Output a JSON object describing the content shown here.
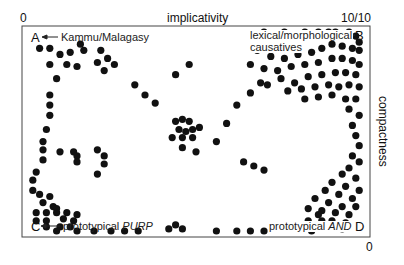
{
  "chart_data": {
    "type": "scatter",
    "title": "",
    "xlabel": "implicativity",
    "ylabel": "compactness",
    "x_axis_ticks": {
      "left": "0",
      "right": "10/10"
    },
    "y_axis_ticks": {
      "top": "",
      "bottom": "0"
    },
    "xlim": [
      0,
      10
    ],
    "ylim": [
      0,
      10
    ],
    "grid": false,
    "legend": null,
    "corners": {
      "A": {
        "label": "A",
        "annotation": "Kammu/Malagasy",
        "position": "top-left"
      },
      "B": {
        "label": "B",
        "annotation": "lexical/morphological causatives",
        "position": "top-right"
      },
      "C": {
        "label": "C",
        "annotation": "prototypical PURP",
        "position": "bottom-left"
      },
      "D": {
        "label": "D",
        "annotation": "prototypical AND",
        "position": "bottom-right"
      }
    },
    "points": [
      [
        0.4,
        9.1
      ],
      [
        0.7,
        9.1
      ],
      [
        1.0,
        8.8
      ],
      [
        1.3,
        8.9
      ],
      [
        1.6,
        9.3
      ],
      [
        1.7,
        9.0
      ],
      [
        0.7,
        8.3
      ],
      [
        1.2,
        8.3
      ],
      [
        1.5,
        8.2
      ],
      [
        0.9,
        7.6
      ],
      [
        2.2,
        9.0
      ],
      [
        2.4,
        8.6
      ],
      [
        2.1,
        8.4
      ],
      [
        2.6,
        8.3
      ],
      [
        2.3,
        8.0
      ],
      [
        0.7,
        6.8
      ],
      [
        0.7,
        6.3
      ],
      [
        0.7,
        5.8
      ],
      [
        0.6,
        5.1
      ],
      [
        0.5,
        4.5
      ],
      [
        0.5,
        4.1
      ],
      [
        0.5,
        3.6
      ],
      [
        0.3,
        3.0
      ],
      [
        3.2,
        7.3
      ],
      [
        3.5,
        6.8
      ],
      [
        3.8,
        6.4
      ],
      [
        4.4,
        7.8
      ],
      [
        4.8,
        8.3
      ],
      [
        4.4,
        5.5
      ],
      [
        4.6,
        5.6
      ],
      [
        4.8,
        5.5
      ],
      [
        4.5,
        5.1
      ],
      [
        4.7,
        5.0
      ],
      [
        4.9,
        5.1
      ],
      [
        5.1,
        5.2
      ],
      [
        4.3,
        4.7
      ],
      [
        4.6,
        4.7
      ],
      [
        4.9,
        4.7
      ],
      [
        4.6,
        4.2
      ],
      [
        5.0,
        4.0
      ],
      [
        5.9,
        5.4
      ],
      [
        6.2,
        6.3
      ],
      [
        6.6,
        6.9
      ],
      [
        6.9,
        7.4
      ],
      [
        5.6,
        4.5
      ],
      [
        6.4,
        3.5
      ],
      [
        6.7,
        3.3
      ],
      [
        7.0,
        3.1
      ],
      [
        1.0,
        4.0
      ],
      [
        1.4,
        4.0
      ],
      [
        1.5,
        3.8
      ],
      [
        1.5,
        3.5
      ],
      [
        2.1,
        4.1
      ],
      [
        2.3,
        3.8
      ],
      [
        2.3,
        3.4
      ],
      [
        2.1,
        2.9
      ],
      [
        0.2,
        2.6
      ],
      [
        0.2,
        2.1
      ],
      [
        0.4,
        1.9
      ],
      [
        0.7,
        1.8
      ],
      [
        0.5,
        1.5
      ],
      [
        0.8,
        1.3
      ],
      [
        0.9,
        1.2
      ],
      [
        0.3,
        1.0
      ],
      [
        0.6,
        1.0
      ],
      [
        0.9,
        1.0
      ],
      [
        1.2,
        1.0
      ],
      [
        0.3,
        0.6
      ],
      [
        0.6,
        0.6
      ],
      [
        1.1,
        0.7
      ],
      [
        1.4,
        0.6
      ],
      [
        1.5,
        0.9
      ],
      [
        0.6,
        0.3
      ],
      [
        1.0,
        0.3
      ],
      [
        1.3,
        0.3
      ],
      [
        0.9,
        0.1
      ],
      [
        1.5,
        0.1
      ],
      [
        2.0,
        0.1
      ],
      [
        2.5,
        0.1
      ],
      [
        2.9,
        0.1
      ],
      [
        3.3,
        0.1
      ],
      [
        4.2,
        0.2
      ],
      [
        4.4,
        0.4
      ],
      [
        4.6,
        0.2
      ],
      [
        5.6,
        0.1
      ],
      [
        6.2,
        0.1
      ],
      [
        6.6,
        0.1
      ],
      [
        7.0,
        0.1
      ],
      [
        7.0,
        9.9
      ],
      [
        7.6,
        9.9
      ],
      [
        8.2,
        9.9
      ],
      [
        8.6,
        9.9
      ],
      [
        8.9,
        9.9
      ],
      [
        9.1,
        9.9
      ],
      [
        9.5,
        9.9
      ],
      [
        9.7,
        9.7
      ],
      [
        9.8,
        9.4
      ],
      [
        6.8,
        9.0
      ],
      [
        7.2,
        8.7
      ],
      [
        7.6,
        8.6
      ],
      [
        8.0,
        8.8
      ],
      [
        8.4,
        8.9
      ],
      [
        8.7,
        9.1
      ],
      [
        9.0,
        9.3
      ],
      [
        9.3,
        9.2
      ],
      [
        9.6,
        9.1
      ],
      [
        9.8,
        9.0
      ],
      [
        6.6,
        8.3
      ],
      [
        7.0,
        8.1
      ],
      [
        7.4,
        8.0
      ],
      [
        7.8,
        8.2
      ],
      [
        8.2,
        8.3
      ],
      [
        8.6,
        8.4
      ],
      [
        9.0,
        8.6
      ],
      [
        9.3,
        8.6
      ],
      [
        9.6,
        8.5
      ],
      [
        9.8,
        8.3
      ],
      [
        7.5,
        7.6
      ],
      [
        7.9,
        7.4
      ],
      [
        8.3,
        7.7
      ],
      [
        8.7,
        7.8
      ],
      [
        9.1,
        7.9
      ],
      [
        9.4,
        7.9
      ],
      [
        9.7,
        7.8
      ],
      [
        7.1,
        7.3
      ],
      [
        7.7,
        7.0
      ],
      [
        8.1,
        7.1
      ],
      [
        8.5,
        7.2
      ],
      [
        8.9,
        7.3
      ],
      [
        9.2,
        7.2
      ],
      [
        9.5,
        7.3
      ],
      [
        9.8,
        7.2
      ],
      [
        8.2,
        6.6
      ],
      [
        8.6,
        6.7
      ],
      [
        9.0,
        6.8
      ],
      [
        9.4,
        6.6
      ],
      [
        9.7,
        6.6
      ],
      [
        9.5,
        6.1
      ],
      [
        9.8,
        5.8
      ],
      [
        9.6,
        5.3
      ],
      [
        9.7,
        4.8
      ],
      [
        9.8,
        4.3
      ],
      [
        9.6,
        3.8
      ],
      [
        9.8,
        3.5
      ],
      [
        9.5,
        3.2
      ],
      [
        9.3,
        2.9
      ],
      [
        9.7,
        2.7
      ],
      [
        9.0,
        2.5
      ],
      [
        9.4,
        2.3
      ],
      [
        9.8,
        2.1
      ],
      [
        8.8,
        2.1
      ],
      [
        9.2,
        1.9
      ],
      [
        9.6,
        1.7
      ],
      [
        8.5,
        1.7
      ],
      [
        8.9,
        1.5
      ],
      [
        9.3,
        1.3
      ],
      [
        9.7,
        1.3
      ],
      [
        8.7,
        1.1
      ],
      [
        9.1,
        1.0
      ],
      [
        9.5,
        0.9
      ],
      [
        8.3,
        1.2
      ],
      [
        8.6,
        0.9
      ],
      [
        8.3,
        0.6
      ],
      [
        8.7,
        0.6
      ],
      [
        9.0,
        0.6
      ],
      [
        9.4,
        0.5
      ],
      [
        8.4,
        0.1
      ],
      [
        9.0,
        0.3
      ],
      [
        9.3,
        0.2
      ]
    ]
  },
  "labels": {
    "x_zero": "0",
    "x_max": "10/10",
    "x_title": "implicativity",
    "y_title": "compactness",
    "y_zero": "0",
    "corner_a": "A",
    "corner_a_note": "Kammu/Malagasy",
    "corner_b": "B",
    "corner_b_note_line1": "lexical/morphological",
    "corner_b_note_line2": "causatives",
    "corner_c": "C",
    "corner_c_note_prefix": "prototypical ",
    "corner_c_note_em": "PURP",
    "corner_d": "D",
    "corner_d_note_prefix": "prototypical ",
    "corner_d_note_em": "AND"
  },
  "style": {
    "point_color": "#111111",
    "frame_color": "#333333",
    "point_radius": 3.6
  }
}
